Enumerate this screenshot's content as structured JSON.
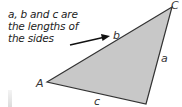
{
  "caption": {
    "lines": [
      "a, b and c are",
      "the lengths of",
      "the sides"
    ]
  },
  "triangle": {
    "fill": "#c8c8c8",
    "stroke": "#333333",
    "vertices": {
      "A": {
        "label": "A",
        "x": 46,
        "y": 82
      },
      "B": {
        "label": "",
        "x": 146,
        "y": 104
      },
      "C": {
        "label": "C",
        "x": 174,
        "y": 5
      }
    },
    "sides": {
      "a": {
        "label": "a"
      },
      "b": {
        "label": "b"
      },
      "c": {
        "label": "c"
      }
    }
  },
  "arrow": {
    "color": "#111111"
  }
}
